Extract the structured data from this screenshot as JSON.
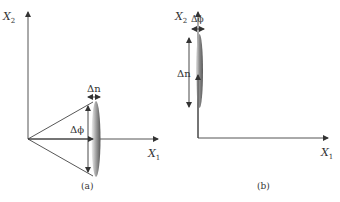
{
  "panels": [
    {
      "id": "a",
      "caption": "(a)",
      "x_axis_label": "X",
      "x_axis_sub": "1",
      "y_axis_label": "X",
      "y_axis_sub": "2",
      "width_label": "Δn",
      "angle_label": "Δϕ"
    },
    {
      "id": "b",
      "caption": "(b)",
      "x_axis_label": "X",
      "x_axis_sub": "1",
      "y_axis_label": "X",
      "y_axis_sub": "2",
      "width_label": "Δϕ",
      "length_label": "Δn"
    }
  ],
  "colors": {
    "axis": "#555555",
    "ellipse_dark": "#6e6e6e",
    "ellipse_light": "#e8e8e8",
    "text": "#333333"
  }
}
